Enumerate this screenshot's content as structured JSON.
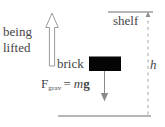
{
  "diagram": {
    "colors": {
      "ink": "#454545",
      "line": "#8a8a8a",
      "brick_fill": "#050505",
      "arrow_outline_stroke": "#9b9b9b",
      "arrow_outline_fill": "#ffffff",
      "background": "#ffffff"
    },
    "labels": {
      "being": "being",
      "lifted": "lifted",
      "brick": "brick",
      "shelf": "shelf",
      "height": "h"
    },
    "formula": {
      "symbol": "F",
      "subscript": "grav",
      "equals": "=",
      "mass": "m",
      "gravity": "g",
      "full_text": "F_grav = mg"
    },
    "elements": [
      {
        "name": "lift-arrow",
        "type": "outlined-arrow",
        "direction": "up"
      },
      {
        "name": "brick-body",
        "type": "filled-rectangle"
      },
      {
        "name": "gravity-arrow",
        "type": "line-arrow",
        "direction": "down"
      },
      {
        "name": "shelf-line",
        "type": "horizontal-line"
      },
      {
        "name": "ground-line",
        "type": "horizontal-line"
      },
      {
        "name": "height-dashed-line",
        "type": "dashed-vertical-line",
        "direction": "up"
      }
    ]
  }
}
